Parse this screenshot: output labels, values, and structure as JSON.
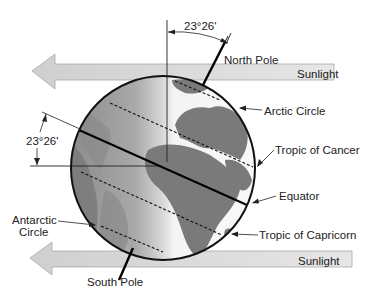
{
  "diagram": {
    "type": "Earth axial tilt at solstice",
    "tilt_angle_label": "23°26'",
    "sunlight_label": "Sunlight",
    "labels": {
      "north_pole": "North Pole",
      "south_pole": "South Pole",
      "arctic_circle": "Arctic Circle",
      "tropic_of_cancer": "Tropic of Cancer",
      "equator": "Equator",
      "tropic_of_capricorn": "Tropic of Capricorn",
      "antarctic_circle_line1": "Antarctic",
      "antarctic_circle_line2": "Circle"
    },
    "colors": {
      "arrow_fill": "#d4d4d4",
      "arrow_stroke": "#a8a8a8",
      "land": "#7a7a7a",
      "ocean_light": "#e8e8e8",
      "ocean_dark": "#9a9a9a",
      "lines": "#111111"
    }
  }
}
